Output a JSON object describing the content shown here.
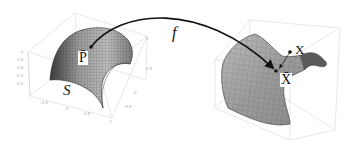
{
  "diagram": {
    "left_surface": {
      "label": "S",
      "shape": "dome / half-cylinder mesh",
      "point_label": "P̄",
      "axis_ticks_z": [
        "1",
        "0.8",
        "0.6",
        "0.4",
        "0.2"
      ],
      "axis_ticks_x": [
        "-0.5",
        "0",
        "0.5",
        "1"
      ],
      "axis_ticks_y": [
        "1",
        "0.5",
        "0",
        "-0.5",
        "-1"
      ]
    },
    "mapping": {
      "label": "f",
      "from": "P̄",
      "to": "X̄"
    },
    "right_surface": {
      "shape": "saddle-like curved mesh",
      "projected_point_label": "X̄",
      "external_point_label": "X"
    },
    "colors": {
      "mesh_fill": "#9a9a9a",
      "mesh_lines": "#444444",
      "box_lines": "#cccccc",
      "arrow": "#111111",
      "background": "#ffffff"
    }
  }
}
